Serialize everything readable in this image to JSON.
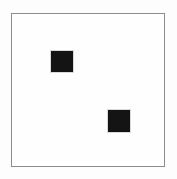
{
  "canvas": {
    "width": 177,
    "height": 179,
    "background_color": "#fdfdfd",
    "label": "stimulus-canvas"
  },
  "frame": {
    "label": "frame-border",
    "x": 11,
    "y": 13,
    "width": 154,
    "height": 154,
    "border_color": "#8c8c8c",
    "border_width": 1,
    "fill_color": "#ffffff"
  },
  "shapes": [
    {
      "id": "square-upper-left",
      "name": "square-upper-left",
      "shape": "square",
      "x": 51,
      "y": 51,
      "width": 22,
      "height": 21,
      "fill_color": "#141414",
      "edge_color": "#d9d9d9"
    },
    {
      "id": "square-lower-right",
      "name": "square-lower-right",
      "shape": "square",
      "x": 108,
      "y": 110,
      "width": 22,
      "height": 22,
      "fill_color": "#141414",
      "edge_color": "#d9d9d9"
    }
  ],
  "description": {
    "summary": "White framed panel containing two small dark squares arranged diagonally",
    "shape_count": "2"
  }
}
